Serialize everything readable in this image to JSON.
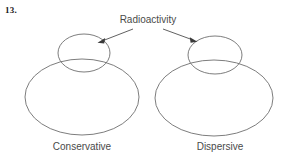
{
  "page": {
    "question_number": "13.",
    "background_color": "#ffffff",
    "stroke_color": "#6e6e6e",
    "text_color": "#4a4a4a",
    "width": 288,
    "height": 165
  },
  "annotation": {
    "label": "Radioactivity",
    "arrows": [
      {
        "name": "arrow-to-conservative",
        "from_x": 133,
        "from_y": 29,
        "to_x": 99,
        "to_y": 42
      },
      {
        "name": "arrow-to-dispersive",
        "from_x": 163,
        "from_y": 29,
        "to_x": 196,
        "to_y": 41
      }
    ]
  },
  "figures": [
    {
      "id": "conservative",
      "caption": "Conservative",
      "body": {
        "cx": 82,
        "cy": 97,
        "rx": 57,
        "ry": 38
      },
      "dome": {
        "cx": 84,
        "cy": 53,
        "rx": 26,
        "ry": 19
      }
    },
    {
      "id": "dispersive",
      "caption": "Dispersive",
      "body": {
        "cx": 214,
        "cy": 98,
        "rx": 59,
        "ry": 38
      },
      "dome": {
        "cx": 215,
        "cy": 55,
        "rx": 27,
        "ry": 19
      }
    }
  ]
}
